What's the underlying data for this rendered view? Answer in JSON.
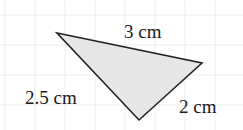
{
  "diagram": {
    "type": "triangle",
    "fill": "#e6e6e6",
    "stroke": "#222222",
    "grid_color": "#ececec",
    "vertices": [
      [
        57,
        33
      ],
      [
        202,
        63
      ],
      [
        139,
        120
      ]
    ],
    "sides": [
      {
        "label": "3 cm",
        "between": "top-left and right"
      },
      {
        "label": "2.5 cm",
        "between": "top-left and bottom"
      },
      {
        "label": "2 cm",
        "between": "right and bottom"
      }
    ]
  }
}
